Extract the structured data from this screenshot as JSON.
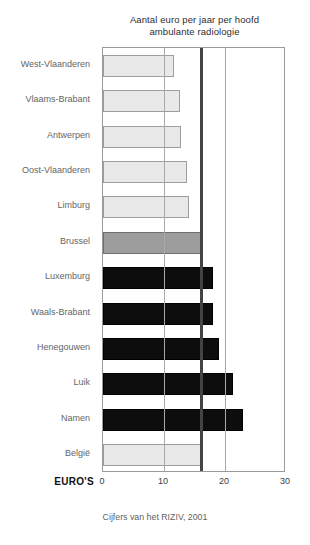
{
  "chart_data": {
    "type": "bar",
    "orientation": "horizontal",
    "title": "Aantal euro per jaar per hoofd ambulante radiologie",
    "title_line1": "Aantal euro per jaar per hoofd",
    "title_line2": "ambulante radiologie",
    "source_note": "Cijfers van het RIZIV, 2001",
    "xlabel": "EURO'S",
    "ylabel": "",
    "xlim": [
      0,
      30
    ],
    "xticks": [
      0,
      10,
      20,
      30
    ],
    "xtick_labels": [
      "0",
      "10",
      "20",
      "30"
    ],
    "grid": true,
    "gridlines_at": [
      10,
      20
    ],
    "reference_line": {
      "value": 16,
      "color": "#444444",
      "label": ""
    },
    "categories": [
      "West-Vlaanderen",
      "Vlaams-Brabant",
      "Antwerpen",
      "Oost-Vlaanderen",
      "Limburg",
      "Brussel",
      "Luxemburg",
      "Waals-Brabant",
      "Henegouwen",
      "Luik",
      "Namen",
      "België"
    ],
    "values": [
      11.6,
      12.6,
      12.8,
      13.8,
      14.1,
      16.1,
      18.0,
      18.1,
      19.0,
      21.3,
      23.0,
      16.0
    ],
    "bar_styles": [
      "light",
      "light",
      "light",
      "light",
      "light",
      "mid",
      "dark",
      "dark",
      "dark",
      "dark",
      "dark",
      "light"
    ],
    "colors": {
      "light": "#e9e9e9",
      "mid": "#9d9d9d",
      "dark": "#0d0d0d",
      "frame": "#9a9a9a",
      "gridline": "#a8a8a8",
      "reference": "#444444"
    }
  }
}
